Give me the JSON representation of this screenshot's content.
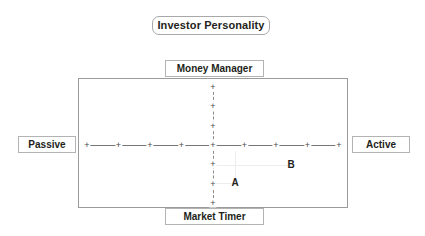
{
  "title": {
    "text": "Investor Personality"
  },
  "axes": {
    "top_label": "Money Manager",
    "bottom_label": "Market Timer",
    "left_label": "Passive",
    "right_label": "Active"
  },
  "chart_data": {
    "type": "scatter",
    "title": "Investor Personality",
    "xlabel": "Passive ↔ Active",
    "ylabel": "Market Timer ↔ Money Manager",
    "x_axis": {
      "left_pole": "Passive",
      "right_pole": "Active",
      "tick_count": 9,
      "tick_glyph": "+",
      "line_style": "solid"
    },
    "y_axis": {
      "top_pole": "Money Manager",
      "bottom_pole": "Market Timer",
      "tick_count": 7,
      "tick_glyph": "+",
      "line_style": "dashed"
    },
    "xlim": [
      -4,
      4
    ],
    "ylim": [
      -3,
      3
    ],
    "grid": false,
    "legend": "none",
    "points": [
      {
        "name": "A",
        "x": 0.7,
        "y": -1.75
      },
      {
        "name": "B",
        "x": 2.1,
        "y": -0.85
      }
    ]
  },
  "ticks": {
    "horizontal": [
      {
        "id": "h-4",
        "glyph": "+",
        "x": 8
      },
      {
        "id": "h-3",
        "glyph": "+",
        "x": 39.5
      },
      {
        "id": "h-2",
        "glyph": "+",
        "x": 71
      },
      {
        "id": "h-1",
        "glyph": "+",
        "x": 102.5
      },
      {
        "id": "h0",
        "glyph": "+",
        "x": 134
      },
      {
        "id": "h1",
        "glyph": "+",
        "x": 165.5
      },
      {
        "id": "h2",
        "glyph": "+",
        "x": 197
      },
      {
        "id": "h3",
        "glyph": "+",
        "x": 228.5
      },
      {
        "id": "h4",
        "glyph": "+",
        "x": 260
      }
    ],
    "vertical": [
      {
        "id": "v3",
        "glyph": "+",
        "y": 8
      },
      {
        "id": "v2",
        "glyph": "+",
        "y": 27.3
      },
      {
        "id": "v1",
        "glyph": "+",
        "y": 46.6
      },
      {
        "id": "v0",
        "glyph": "+",
        "y": 66
      },
      {
        "id": "v-1",
        "glyph": "+",
        "y": 85.3
      },
      {
        "id": "v-2",
        "glyph": "+",
        "y": 104.6
      },
      {
        "id": "v-3",
        "glyph": "+",
        "y": 124
      }
    ]
  },
  "markers": [
    {
      "name": "A",
      "label": "A",
      "left": 156,
      "top": 104
    },
    {
      "name": "B",
      "label": "B",
      "left": 212,
      "top": 86
    }
  ],
  "guides": [
    {
      "name": "guide-a-horizontal",
      "orient": "h",
      "left": 134,
      "top": 104,
      "length": 22
    },
    {
      "name": "guide-b-horizontal",
      "orient": "h",
      "left": 134,
      "top": 86,
      "length": 78
    },
    {
      "name": "guide-b-vertical",
      "orient": "v",
      "left": 156,
      "top": 72,
      "length": 32
    }
  ],
  "colors": {
    "background": "#ffffff",
    "frame_border": "#9b9b9b",
    "label_border": "#b3b3b3",
    "title_border": "#a8a8a8",
    "axis_line": "#767676",
    "guide_line": "#ededed",
    "text": "#231f20"
  }
}
